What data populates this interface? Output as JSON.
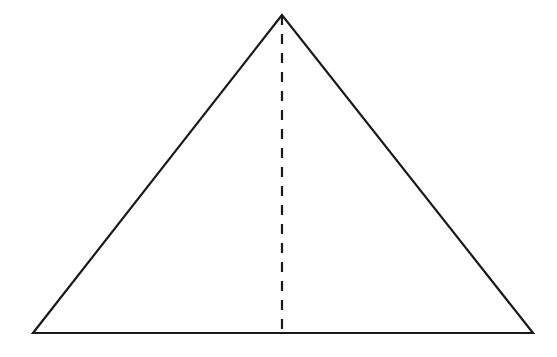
{
  "diagram": {
    "type": "geometry",
    "shape": "isosceles-triangle-with-altitude",
    "stroke_color": "#1a1a1a",
    "background_color": "#ffffff",
    "vertices": {
      "apex": [
        282,
        15
      ],
      "base_left": [
        33,
        333
      ],
      "base_right": [
        533,
        333
      ]
    },
    "altitude": {
      "from": [
        282,
        15
      ],
      "to": [
        282,
        333
      ],
      "style": "dashed",
      "dash": "10 9"
    },
    "labels": []
  }
}
